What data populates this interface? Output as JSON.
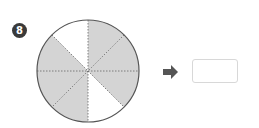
{
  "problem": {
    "number": "8",
    "figure": {
      "type": "circle-fraction",
      "total_parts": 8,
      "shaded_parts": 6,
      "unshaded_parts": 2,
      "shade_color": "#d4d4d4",
      "outline_color": "#555555",
      "divider_color": "#666666"
    },
    "arrow_icon": "right-arrow",
    "answer_value": ""
  }
}
